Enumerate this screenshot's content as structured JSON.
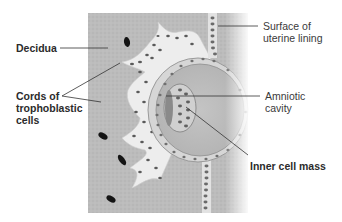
{
  "diagram": {
    "type": "anatomical-illustration",
    "colors": {
      "decidua": "#b9b9b9",
      "trophoblast": "#ececec",
      "nuclei": "#555555",
      "cavity": "#bdbdbd",
      "blood_cell": "#1a1a1a",
      "leader_line": "#333333",
      "text": "#2b2b2b"
    }
  },
  "labels": {
    "decidua": "Decidua",
    "cords": "Cords of\ntrophoblastic\ncells",
    "surface": "Surface of\nuterine lining",
    "amniotic": "Amniotic\ncavity",
    "inner_cell_mass": "Inner cell mass"
  }
}
